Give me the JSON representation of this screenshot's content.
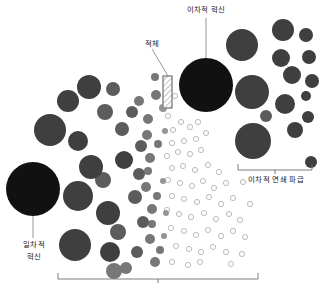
{
  "figure": {
    "type": "diagram",
    "title": "",
    "background_color": "#ffffff",
    "width": 321,
    "height": 289
  },
  "labels": {
    "secondary_innovation": "이차적 혁신",
    "bottleneck": "적체",
    "primary_innovation_line1": "일차적",
    "primary_innovation_line2": "혁신",
    "secondary_chain_spread": "이차적 연쇄 파급"
  },
  "colors": {
    "black_node": "#111111",
    "dark_gray_node": "#3f3f3f",
    "mid_gray_node": "#5c5c5c",
    "gray_node": "#777777",
    "light_gray_node": "#949494",
    "hollow_node_stroke": "#b4b4b4",
    "leader_line": "#8c8c8c",
    "bracket_line": "#6e6e6e",
    "hatch_stroke": "#8a8a8a",
    "text": "#1a1a1a"
  },
  "nodes": {
    "black": [
      {
        "cx": 33,
        "cy": 189,
        "r": 27
      },
      {
        "cx": 206,
        "cy": 85,
        "r": 27
      }
    ],
    "dark_gray": [
      {
        "cx": 50,
        "cy": 130,
        "r": 16
      },
      {
        "cx": 68,
        "cy": 101,
        "r": 11
      },
      {
        "cx": 89,
        "cy": 87,
        "r": 12
      },
      {
        "cx": 78,
        "cy": 141,
        "r": 10
      },
      {
        "cx": 91,
        "cy": 167,
        "r": 12
      },
      {
        "cx": 78,
        "cy": 196,
        "r": 15
      },
      {
        "cx": 75,
        "cy": 245,
        "r": 16
      },
      {
        "cx": 108,
        "cy": 213,
        "r": 12
      },
      {
        "cx": 110,
        "cy": 252,
        "r": 10
      },
      {
        "cx": 124,
        "cy": 160,
        "r": 9
      },
      {
        "cx": 242,
        "cy": 45,
        "r": 16
      },
      {
        "cx": 252,
        "cy": 92,
        "r": 17
      },
      {
        "cx": 253,
        "cy": 141,
        "r": 18
      },
      {
        "cx": 283,
        "cy": 30,
        "r": 11
      },
      {
        "cx": 281,
        "cy": 58,
        "r": 9
      },
      {
        "cx": 292,
        "cy": 75,
        "r": 9
      },
      {
        "cx": 285,
        "cy": 104,
        "r": 10
      },
      {
        "cx": 295,
        "cy": 130,
        "r": 8
      },
      {
        "cx": 306,
        "cy": 35,
        "r": 7
      },
      {
        "cx": 309,
        "cy": 57,
        "r": 7
      },
      {
        "cx": 312,
        "cy": 81,
        "r": 7
      },
      {
        "cx": 306,
        "cy": 96,
        "r": 5
      },
      {
        "cx": 308,
        "cy": 117,
        "r": 6
      },
      {
        "cx": 311,
        "cy": 162,
        "r": 6
      }
    ],
    "mid_gray": [
      {
        "cx": 105,
        "cy": 112,
        "r": 8
      },
      {
        "cx": 113,
        "cy": 89,
        "r": 7
      },
      {
        "cx": 122,
        "cy": 129,
        "r": 7
      },
      {
        "cx": 103,
        "cy": 180,
        "r": 8
      },
      {
        "cx": 118,
        "cy": 232,
        "r": 8
      },
      {
        "cx": 135,
        "cy": 197,
        "r": 7
      },
      {
        "cx": 132,
        "cy": 112,
        "r": 6
      },
      {
        "cx": 141,
        "cy": 146,
        "r": 6
      },
      {
        "cx": 139,
        "cy": 174,
        "r": 6
      },
      {
        "cx": 143,
        "cy": 222,
        "r": 6
      },
      {
        "cx": 137,
        "cy": 252,
        "r": 6
      },
      {
        "cx": 266,
        "cy": 116,
        "r": 6
      }
    ],
    "gray": [
      {
        "cx": 139,
        "cy": 101,
        "r": 5
      },
      {
        "cx": 148,
        "cy": 119,
        "r": 5
      },
      {
        "cx": 147,
        "cy": 135,
        "r": 5
      },
      {
        "cx": 150,
        "cy": 158,
        "r": 5
      },
      {
        "cx": 146,
        "cy": 187,
        "r": 5
      },
      {
        "cx": 152,
        "cy": 209,
        "r": 5
      },
      {
        "cx": 150,
        "cy": 239,
        "r": 5
      },
      {
        "cx": 155,
        "cy": 262,
        "r": 5
      },
      {
        "cx": 156,
        "cy": 95,
        "r": 5
      },
      {
        "cx": 155,
        "cy": 77,
        "r": 4
      },
      {
        "cx": 148,
        "cy": 171,
        "r": 4
      },
      {
        "cx": 152,
        "cy": 224,
        "r": 4
      },
      {
        "cx": 160,
        "cy": 250,
        "r": 4
      },
      {
        "cx": 158,
        "cy": 144,
        "r": 4
      },
      {
        "cx": 157,
        "cy": 196,
        "r": 4
      },
      {
        "cx": 126,
        "cy": 268,
        "r": 6
      },
      {
        "cx": 114,
        "cy": 271,
        "r": 8
      }
    ],
    "light_gray": [
      {
        "cx": 163,
        "cy": 108,
        "r": 4
      },
      {
        "cx": 165,
        "cy": 131,
        "r": 3
      },
      {
        "cx": 163,
        "cy": 181,
        "r": 3
      },
      {
        "cx": 166,
        "cy": 213,
        "r": 3
      },
      {
        "cx": 164,
        "cy": 236,
        "r": 3
      }
    ],
    "hollow": [
      {
        "cx": 168,
        "cy": 116,
        "r": 2.6
      },
      {
        "cx": 173,
        "cy": 130,
        "r": 2.6
      },
      {
        "cx": 181,
        "cy": 122,
        "r": 2.6
      },
      {
        "cx": 190,
        "cy": 127,
        "r": 2.6
      },
      {
        "cx": 198,
        "cy": 122,
        "r": 2.6
      },
      {
        "cx": 172,
        "cy": 143,
        "r": 2.6
      },
      {
        "cx": 184,
        "cy": 141,
        "r": 2.6
      },
      {
        "cx": 196,
        "cy": 139,
        "r": 2.6
      },
      {
        "cx": 206,
        "cy": 133,
        "r": 2.6
      },
      {
        "cx": 167,
        "cy": 156,
        "r": 2.6
      },
      {
        "cx": 178,
        "cy": 152,
        "r": 2.6
      },
      {
        "cx": 190,
        "cy": 154,
        "r": 2.6
      },
      {
        "cx": 201,
        "cy": 150,
        "r": 2.6
      },
      {
        "cx": 172,
        "cy": 168,
        "r": 2.6
      },
      {
        "cx": 183,
        "cy": 166,
        "r": 2.6
      },
      {
        "cx": 195,
        "cy": 170,
        "r": 2.6
      },
      {
        "cx": 208,
        "cy": 165,
        "r": 2.6
      },
      {
        "cx": 219,
        "cy": 172,
        "r": 2.6
      },
      {
        "cx": 168,
        "cy": 180,
        "r": 2.6
      },
      {
        "cx": 180,
        "cy": 183,
        "r": 2.6
      },
      {
        "cx": 192,
        "cy": 186,
        "r": 2.6
      },
      {
        "cx": 203,
        "cy": 181,
        "r": 2.6
      },
      {
        "cx": 214,
        "cy": 188,
        "r": 2.6
      },
      {
        "cx": 226,
        "cy": 183,
        "r": 2.6
      },
      {
        "cx": 172,
        "cy": 196,
        "r": 2.6
      },
      {
        "cx": 184,
        "cy": 199,
        "r": 2.6
      },
      {
        "cx": 197,
        "cy": 202,
        "r": 2.6
      },
      {
        "cx": 209,
        "cy": 197,
        "r": 2.6
      },
      {
        "cx": 221,
        "cy": 204,
        "r": 2.6
      },
      {
        "cx": 233,
        "cy": 198,
        "r": 2.6
      },
      {
        "cx": 167,
        "cy": 210,
        "r": 2.6
      },
      {
        "cx": 179,
        "cy": 214,
        "r": 2.6
      },
      {
        "cx": 191,
        "cy": 217,
        "r": 2.6
      },
      {
        "cx": 204,
        "cy": 213,
        "r": 2.6
      },
      {
        "cx": 216,
        "cy": 219,
        "r": 2.6
      },
      {
        "cx": 229,
        "cy": 214,
        "r": 2.6
      },
      {
        "cx": 240,
        "cy": 220,
        "r": 2.6
      },
      {
        "cx": 171,
        "cy": 228,
        "r": 2.6
      },
      {
        "cx": 184,
        "cy": 231,
        "r": 2.6
      },
      {
        "cx": 196,
        "cy": 235,
        "r": 2.6
      },
      {
        "cx": 208,
        "cy": 230,
        "r": 2.6
      },
      {
        "cx": 221,
        "cy": 236,
        "r": 2.6
      },
      {
        "cx": 233,
        "cy": 231,
        "r": 2.6
      },
      {
        "cx": 245,
        "cy": 237,
        "r": 2.6
      },
      {
        "cx": 176,
        "cy": 246,
        "r": 2.6
      },
      {
        "cx": 189,
        "cy": 249,
        "r": 2.6
      },
      {
        "cx": 201,
        "cy": 252,
        "r": 2.6
      },
      {
        "cx": 213,
        "cy": 247,
        "r": 2.6
      },
      {
        "cx": 226,
        "cy": 252,
        "r": 2.6
      },
      {
        "cx": 172,
        "cy": 262,
        "r": 2.6
      },
      {
        "cx": 188,
        "cy": 265,
        "r": 2.6
      },
      {
        "cx": 200,
        "cy": 262,
        "r": 2.6
      },
      {
        "cx": 231,
        "cy": 264,
        "r": 2.6
      },
      {
        "cx": 175,
        "cy": 96,
        "r": 2.6
      },
      {
        "cx": 167,
        "cy": 103,
        "r": 2.6
      },
      {
        "cx": 243,
        "cy": 182,
        "r": 2.6
      },
      {
        "cx": 250,
        "cy": 204,
        "r": 2.6
      },
      {
        "cx": 242,
        "cy": 254,
        "r": 2.6
      }
    ]
  },
  "bottleneck_rect": {
    "x": 163,
    "y": 76,
    "width": 9,
    "height": 32,
    "hatch": "diagonal"
  },
  "leader_lines": [
    {
      "name": "secondary-innovation-leader",
      "x1": 206,
      "y1": 18,
      "x2": 206,
      "y2": 58
    },
    {
      "name": "bottleneck-leader",
      "x1": 152,
      "y1": 49,
      "x2": 168,
      "y2": 76
    },
    {
      "name": "primary-innovation-leader",
      "x1": 33,
      "y1": 216,
      "x2": 33,
      "y2": 238
    }
  ],
  "brackets": [
    {
      "name": "secondary-chain-bracket",
      "x1": 238,
      "x2": 312,
      "y": 170,
      "tick": 6
    },
    {
      "name": "bottom-bracket",
      "x1": 58,
      "x2": 258,
      "y": 279,
      "tick": 6
    }
  ]
}
